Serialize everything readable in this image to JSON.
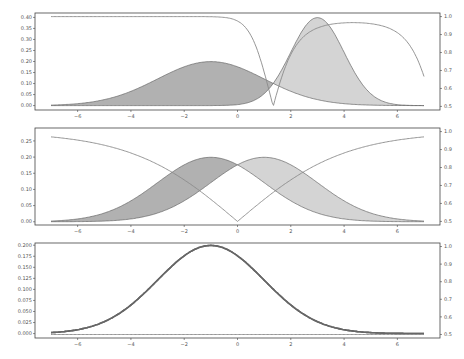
{
  "chart_data": [
    {
      "type": "area",
      "title": "",
      "xlabel": "",
      "ylabel": "",
      "y2label": "",
      "xlim": [
        -7.6,
        7.6
      ],
      "ylim": [
        -0.02,
        0.42
      ],
      "y2lim": [
        0.48,
        1.02
      ],
      "xticks": [
        "-6",
        "-4",
        "-2",
        "0",
        "2",
        "4",
        "6"
      ],
      "yticks": [
        "0.00",
        "0.05",
        "0.10",
        "0.15",
        "0.20",
        "0.25",
        "0.30",
        "0.35",
        "0.40"
      ],
      "y2ticks": [
        "0.5",
        "0.6",
        "0.7",
        "0.8",
        "0.9",
        "1.0"
      ],
      "grid": false,
      "series": [
        {
          "name": "density A (mean -1, sd 2)",
          "kind": "filled",
          "color": "#a8a8a8",
          "mu": -1,
          "sigma": 2,
          "peak": 0.2
        },
        {
          "name": "density B (mean 3, sd 1)",
          "kind": "filled",
          "color": "#cfcfcf",
          "mu": 3,
          "sigma": 1,
          "peak": 0.4
        },
        {
          "name": "ratio curve",
          "kind": "line",
          "axis": "right",
          "color": "#888888",
          "min_at_x": 1.2,
          "min_value": 0.5,
          "plateau_left": 1.0,
          "plateau_right": 0.97,
          "end_value": 0.67
        }
      ]
    },
    {
      "type": "area",
      "xlim": [
        -7.6,
        7.6
      ],
      "ylim": [
        -0.01,
        0.29
      ],
      "y2lim": [
        0.48,
        1.02
      ],
      "xticks": [
        "-6",
        "-4",
        "-2",
        "0",
        "2",
        "4",
        "6"
      ],
      "yticks": [
        "0.00",
        "0.05",
        "0.10",
        "0.15",
        "0.20",
        "0.25"
      ],
      "y2ticks": [
        "0.5",
        "0.6",
        "0.7",
        "0.8",
        "0.9",
        "1.0"
      ],
      "grid": false,
      "series": [
        {
          "name": "density A (mean -1, sd 2)",
          "kind": "filled",
          "color": "#a8a8a8",
          "mu": -1,
          "sigma": 2,
          "peak": 0.2
        },
        {
          "name": "density B (mean 1, sd 2)",
          "kind": "filled",
          "color": "#cfcfcf",
          "mu": 1,
          "sigma": 2,
          "peak": 0.2
        },
        {
          "name": "ratio curve",
          "kind": "line",
          "axis": "right",
          "color": "#888888",
          "min_at_x": -0.3,
          "min_value": 0.5,
          "plateau_left": 1.0,
          "peak_right": 0.81,
          "end_value": 0.58
        }
      ]
    },
    {
      "type": "line",
      "xlim": [
        -7.6,
        7.6
      ],
      "ylim": [
        -0.01,
        0.205
      ],
      "y2lim": [
        0.48,
        1.02
      ],
      "xticks": [
        "-6",
        "-4",
        "-2",
        "0",
        "2",
        "4",
        "6"
      ],
      "yticks": [
        "0.000",
        "0.025",
        "0.050",
        "0.075",
        "0.100",
        "0.125",
        "0.150",
        "0.175",
        "0.200"
      ],
      "y2ticks": [
        "0.5",
        "0.6",
        "0.7",
        "0.8",
        "0.9",
        "1.0"
      ],
      "grid": false,
      "series": [
        {
          "name": "density A (mean -1, sd 2)",
          "kind": "filled",
          "color": "#a8a8a8",
          "mu": -1,
          "sigma": 2,
          "peak": 0.2
        },
        {
          "name": "density B (mean -1, sd 2)",
          "kind": "filled",
          "color": "#cfcfcf",
          "mu": -1,
          "sigma": 2,
          "peak": 0.2
        },
        {
          "name": "ratio curve",
          "kind": "line",
          "axis": "right",
          "color": "#777777",
          "note": "constant 0.5, overlaps baseline"
        }
      ]
    }
  ]
}
